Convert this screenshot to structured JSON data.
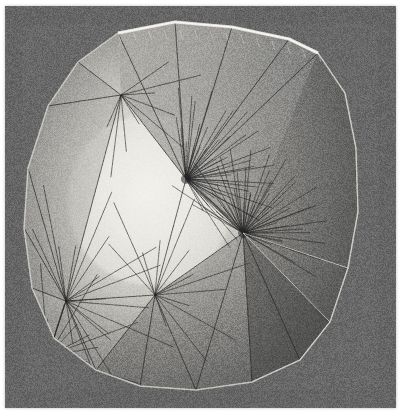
{
  "image": {
    "kind": "3d-surface-render",
    "title": "Triangulated convex surface mesh render",
    "width": 406,
    "height": 419,
    "page_background": "#ffffff",
    "render_background": "#6b6b6b",
    "render_background_dark": "#5e5e5e",
    "render_rect": {
      "x": 5,
      "y": 6,
      "w": 391,
      "h": 402
    },
    "noise_opacity": 0.55
  },
  "palette": {
    "highlight": "#f2f0ea",
    "bright": "#dedcd6",
    "mid_light": "#b8b6b0",
    "mid": "#949490",
    "mid_dark": "#7a7a78",
    "dark": "#5a5a5a",
    "darker": "#4a4a4a",
    "shadow": "#3e3e3e",
    "wire_dark": "#262626",
    "wire_light": "#e8e6e0",
    "silhouette": "#cfcdc7"
  },
  "geometry": {
    "silhouette": [
      [
        118,
        33
      ],
      [
        175,
        22
      ],
      [
        232,
        27
      ],
      [
        289,
        39
      ],
      [
        318,
        53
      ],
      [
        345,
        93
      ],
      [
        356,
        148
      ],
      [
        358,
        212
      ],
      [
        348,
        268
      ],
      [
        330,
        322
      ],
      [
        300,
        360
      ],
      [
        252,
        382
      ],
      [
        196,
        390
      ],
      [
        140,
        386
      ],
      [
        96,
        370
      ],
      [
        54,
        338
      ],
      [
        32,
        288
      ],
      [
        24,
        228
      ],
      [
        28,
        168
      ],
      [
        48,
        106
      ],
      [
        78,
        62
      ]
    ],
    "fans": [
      {
        "name": "fan-upper",
        "cx": 186,
        "cy": 179,
        "count": 46,
        "a0": -1.75,
        "a1": 1.05,
        "r0": 26,
        "r1": 92,
        "dense": true
      },
      {
        "name": "fan-lower",
        "cx": 243,
        "cy": 233,
        "count": 52,
        "a0": -2.65,
        "a1": 0.55,
        "r0": 24,
        "r1": 86,
        "dense": true
      },
      {
        "name": "fan-left-lower",
        "cx": 66,
        "cy": 301,
        "count": 17,
        "a0": -2.05,
        "a1": 1.45,
        "r0": 30,
        "r1": 120,
        "dense": false
      },
      {
        "name": "fan-mid-lower",
        "cx": 155,
        "cy": 295,
        "count": 13,
        "a0": -2.35,
        "a1": 1.15,
        "r0": 26,
        "r1": 104,
        "dense": false
      },
      {
        "name": "fan-top-left",
        "cx": 121,
        "cy": 95,
        "count": 9,
        "a0": -0.65,
        "a1": 2.05,
        "r0": 24,
        "r1": 86,
        "dense": false
      },
      {
        "name": "fan-bottom-left",
        "cx": 48,
        "cy": 356,
        "count": 11,
        "a0": -1.95,
        "a1": 0.35,
        "r0": 22,
        "r1": 96,
        "dense": false
      }
    ],
    "edges_dark": [
      [
        118,
        33,
        186,
        179
      ],
      [
        175,
        22,
        186,
        179
      ],
      [
        78,
        62,
        121,
        95
      ],
      [
        121,
        95,
        186,
        179
      ],
      [
        121,
        95,
        66,
        301
      ],
      [
        48,
        106,
        121,
        95
      ],
      [
        28,
        168,
        66,
        301
      ],
      [
        24,
        228,
        66,
        301
      ],
      [
        32,
        288,
        66,
        301
      ],
      [
        66,
        301,
        155,
        295
      ],
      [
        66,
        301,
        48,
        356
      ],
      [
        48,
        356,
        96,
        370
      ],
      [
        96,
        370,
        155,
        295
      ],
      [
        155,
        295,
        186,
        179
      ],
      [
        155,
        295,
        243,
        233
      ],
      [
        186,
        179,
        243,
        233
      ],
      [
        243,
        233,
        196,
        390
      ],
      [
        243,
        233,
        300,
        360
      ],
      [
        140,
        386,
        155,
        295
      ],
      [
        196,
        390,
        155,
        295
      ],
      [
        252,
        382,
        243,
        233
      ],
      [
        289,
        39,
        186,
        179
      ],
      [
        232,
        27,
        186,
        179
      ],
      [
        318,
        53,
        186,
        179
      ],
      [
        54,
        338,
        66,
        301
      ],
      [
        96,
        370,
        66,
        301
      ]
    ],
    "edges_light": [
      [
        318,
        53,
        345,
        93
      ],
      [
        345,
        93,
        356,
        148
      ],
      [
        356,
        148,
        358,
        212
      ],
      [
        358,
        212,
        348,
        268
      ],
      [
        348,
        268,
        330,
        322
      ],
      [
        330,
        322,
        300,
        360
      ],
      [
        243,
        233,
        330,
        322
      ],
      [
        243,
        233,
        348,
        268
      ],
      [
        300,
        360,
        330,
        322
      ],
      [
        289,
        39,
        318,
        53
      ],
      [
        252,
        382,
        300,
        360
      ]
    ],
    "ridge_highlight": [
      [
        118,
        33
      ],
      [
        175,
        22
      ],
      [
        232,
        27
      ],
      [
        289,
        39
      ],
      [
        318,
        53
      ]
    ],
    "dark_faces": [
      [
        [
          243,
          233
        ],
        [
          330,
          322
        ],
        [
          300,
          360
        ],
        [
          252,
          382
        ]
      ],
      [
        [
          243,
          233
        ],
        [
          348,
          268
        ],
        [
          330,
          322
        ]
      ],
      [
        [
          318,
          53
        ],
        [
          345,
          93
        ],
        [
          356,
          148
        ],
        [
          358,
          212
        ],
        [
          348,
          268
        ],
        [
          243,
          233
        ]
      ]
    ],
    "bright_core": {
      "cx": 150,
      "cy": 200,
      "rx": 150,
      "ry": 170
    }
  }
}
